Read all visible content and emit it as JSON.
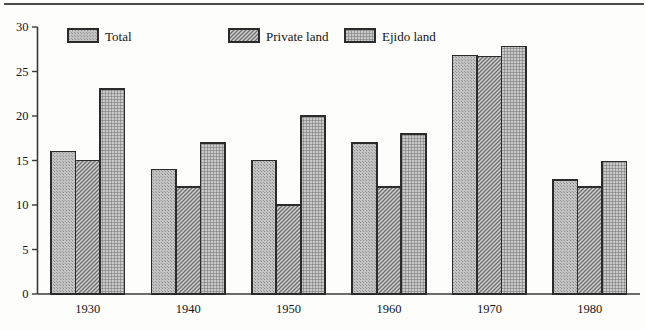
{
  "chart_data": {
    "type": "bar",
    "title": "",
    "subtitle": "",
    "xlabel": "",
    "ylabel": "",
    "categories": [
      "1930",
      "1940",
      "1950",
      "1960",
      "1970",
      "1980"
    ],
    "series": [
      {
        "name": "Total",
        "pattern": "stipple",
        "values": [
          16,
          14,
          15,
          17,
          26.8,
          12.8
        ]
      },
      {
        "name": "Private land",
        "pattern": "diagonal",
        "values": [
          15,
          12,
          10,
          12,
          26.7,
          12
        ]
      },
      {
        "name": "Ejido land",
        "pattern": "crosshatch",
        "values": [
          23,
          17,
          20,
          18,
          27.8,
          14.9
        ]
      }
    ],
    "ylim": [
      0,
      30
    ],
    "ytick_values": [
      0,
      5,
      10,
      15,
      20,
      25,
      30
    ],
    "ytick_labels": [
      "0",
      "5",
      "10",
      "15",
      "20",
      "25",
      "30"
    ],
    "grid": false,
    "legend_position": "top-inside",
    "axis_color": "#3a3a3a",
    "bar_edge_color": "#2b2b2b",
    "bar_fill_color": "#b3b3b3",
    "background_color": "#fdfdfc"
  },
  "legend": {
    "items": [
      {
        "label": "Total"
      },
      {
        "label": "Private land"
      },
      {
        "label": "Ejido land"
      }
    ]
  },
  "axes": {
    "y_ticks": [
      "30",
      "25",
      "20",
      "15",
      "10",
      "5",
      "0"
    ],
    "x_ticks": [
      "1930",
      "1940",
      "1950",
      "1960",
      "1970",
      "1980"
    ]
  }
}
